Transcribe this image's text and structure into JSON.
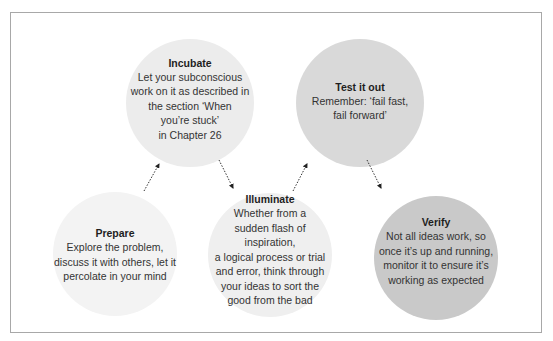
{
  "diagram": {
    "type": "process-flow",
    "steps": [
      {
        "id": "prepare",
        "title": "Prepare",
        "body": "Explore the problem,\ndiscuss it with others, let it\npercolate in your mind",
        "fill": "#f3f3f3"
      },
      {
        "id": "incubate",
        "title": "Incubate",
        "body": "Let your subconscious\nwork on it as described in\nthe section ‘When\nyou’re stuck’\nin Chapter 26",
        "fill": "#ececec"
      },
      {
        "id": "illuminate",
        "title": "Illuminate",
        "body": "Whether from a\nsudden flash of inspiration,\na logical process or trial\nand error, think through\nyour ideas to sort the\ngood from the bad",
        "fill": "#efefef"
      },
      {
        "id": "test",
        "title": "Test it out",
        "body": "Remember: ‘fail fast,\nfail forward’",
        "fill": "#d9d9d9"
      },
      {
        "id": "verify",
        "title": "Verify",
        "body": "Not all ideas work, so\nonce it’s up and running,\nmonitor it to ensure it’s\nworking as expected",
        "fill": "#c9c9c9"
      }
    ],
    "connections": [
      {
        "from": "prepare",
        "to": "incubate",
        "style": "dotted-arrow"
      },
      {
        "from": "incubate",
        "to": "illuminate",
        "style": "dotted-arrow"
      },
      {
        "from": "illuminate",
        "to": "test",
        "style": "dotted-arrow"
      },
      {
        "from": "test",
        "to": "verify",
        "style": "dotted-arrow"
      }
    ],
    "colors": {
      "frame_border": "#a8a8a8",
      "arrow": "#222222",
      "text": "#2a2a2a"
    }
  }
}
